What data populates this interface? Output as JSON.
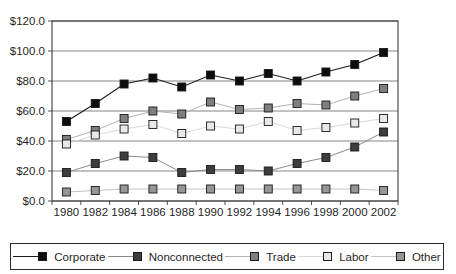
{
  "chart_data": {
    "type": "line",
    "title": "",
    "xlabel": "",
    "ylabel": "",
    "x": [
      "1980",
      "1982",
      "1984",
      "1986",
      "1988",
      "1990",
      "1992",
      "1994",
      "1996",
      "1998",
      "2000",
      "2002"
    ],
    "y_ticks": [
      "$0.0",
      "$20.0",
      "$40.0",
      "$60.0",
      "$80.0",
      "$100.0",
      "$120.0"
    ],
    "ylim": [
      0,
      120
    ],
    "grid": "horizontal",
    "legend_position": "bottom",
    "series": [
      {
        "name": "Corporate",
        "marker_fill": "#0d0d0d",
        "line_color": "#1a1a1a",
        "values": [
          53,
          65,
          78,
          82,
          76,
          84,
          80,
          85,
          80,
          86,
          91,
          99
        ]
      },
      {
        "name": "Nonconnected",
        "marker_fill": "#3d3d3d",
        "line_color": "#8c8c8c",
        "values": [
          19,
          25,
          30,
          29,
          19,
          21,
          21,
          20,
          25,
          29,
          36,
          46
        ]
      },
      {
        "name": "Trade",
        "marker_fill": "#7f7f7f",
        "line_color": "#b3b3b3",
        "values": [
          41,
          47,
          55,
          60,
          58,
          66,
          61,
          62,
          65,
          64,
          70,
          75
        ]
      },
      {
        "name": "Labor",
        "marker_fill": "#e8e8e8",
        "line_color": "#d9d9d9",
        "values": [
          38,
          44,
          48,
          51,
          45,
          50,
          48,
          53,
          47,
          49,
          52,
          55
        ]
      },
      {
        "name": "Other",
        "marker_fill": "#969696",
        "line_color": "#c4c4c4",
        "values": [
          6,
          7,
          8,
          8,
          8,
          8,
          8,
          8,
          8,
          8,
          8,
          7
        ]
      }
    ]
  },
  "colors": {
    "background": "#ffffff",
    "plot_border": "#2b2b2b",
    "gridline": "#4d4d4d",
    "tick": "#2b2b2b",
    "text": "#1f1f1f",
    "legend_border": "#2b2b2b"
  }
}
